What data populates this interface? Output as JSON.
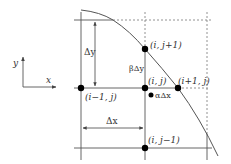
{
  "diagram": {
    "type": "finite-difference grid near curved boundary",
    "colors": {
      "line": "#555555",
      "dashed": "#777777",
      "node": "#000000",
      "text": "#333333"
    },
    "axes_indicator": {
      "x_label": "x",
      "y_label": "y"
    },
    "nodes": [
      {
        "id": "center",
        "label": "(i, j)"
      },
      {
        "id": "top",
        "label": "(i, j+1)"
      },
      {
        "id": "left",
        "label": "(i−1, j)"
      },
      {
        "id": "right",
        "label": "(i+1, j)"
      },
      {
        "id": "bottom",
        "label": "(i, j−1)"
      }
    ],
    "dimensions": {
      "delta_y": "Δy",
      "delta_x": "Δx",
      "beta_delta_y": "βΔy",
      "alpha_delta_x": "αΔx"
    }
  }
}
